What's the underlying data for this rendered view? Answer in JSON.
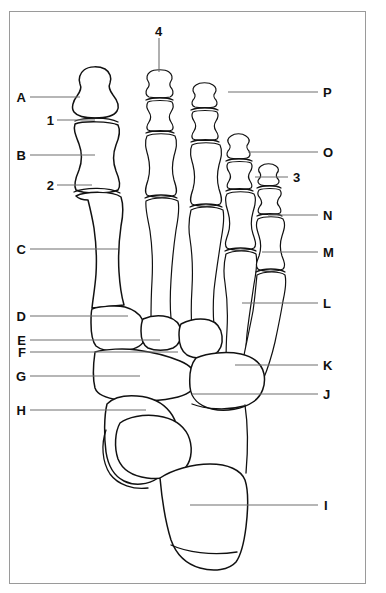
{
  "figure": {
    "type": "anatomical-diagram",
    "background_color": "#ffffff",
    "border_color": "#9a9a9a",
    "outline_color": "#111111",
    "leader_color": "#6f6f6f"
  },
  "labels": {
    "left": [
      {
        "id": "A",
        "text": "A",
        "x": 18,
        "y": 91,
        "leader_from": 30,
        "leader_to": 80,
        "leader_y": 97
      },
      {
        "id": "1",
        "text": "1",
        "x": 46,
        "y": 114,
        "leader_from": 57,
        "leader_to": 95,
        "leader_y": 120
      },
      {
        "id": "B",
        "text": "B",
        "x": 18,
        "y": 149,
        "leader_from": 30,
        "leader_to": 95,
        "leader_y": 155
      },
      {
        "id": "2",
        "text": "2",
        "x": 46,
        "y": 179,
        "leader_from": 57,
        "leader_to": 92,
        "leader_y": 185
      },
      {
        "id": "C",
        "text": "C",
        "x": 18,
        "y": 243,
        "leader_from": 30,
        "leader_to": 118,
        "leader_y": 249
      },
      {
        "id": "D",
        "text": "D",
        "x": 18,
        "y": 310,
        "leader_from": 30,
        "leader_to": 128,
        "leader_y": 316
      },
      {
        "id": "E",
        "text": "E",
        "x": 18,
        "y": 334,
        "leader_from": 30,
        "leader_to": 160,
        "leader_y": 340
      },
      {
        "id": "F",
        "text": "F",
        "x": 18,
        "y": 346,
        "leader_from": 30,
        "leader_to": 178,
        "leader_y": 352
      },
      {
        "id": "G",
        "text": "G",
        "x": 18,
        "y": 370,
        "leader_from": 30,
        "leader_to": 140,
        "leader_y": 376
      },
      {
        "id": "H",
        "text": "H",
        "x": 18,
        "y": 404,
        "leader_from": 30,
        "leader_to": 146,
        "leader_y": 410
      }
    ],
    "right": [
      {
        "id": "P",
        "text": "P",
        "x": 325,
        "y": 86,
        "leader_from": 228,
        "leader_to": 318,
        "leader_y": 92
      },
      {
        "id": "O",
        "text": "O",
        "x": 325,
        "y": 146,
        "leader_from": 248,
        "leader_to": 318,
        "leader_y": 152
      },
      {
        "id": "3",
        "text": "3",
        "x": 294,
        "y": 171,
        "leader_from": 255,
        "leader_to": 288,
        "leader_y": 177
      },
      {
        "id": "N",
        "text": "N",
        "x": 325,
        "y": 209,
        "leader_from": 268,
        "leader_to": 318,
        "leader_y": 215
      },
      {
        "id": "M",
        "text": "M",
        "x": 325,
        "y": 246,
        "leader_from": 262,
        "leader_to": 318,
        "leader_y": 252
      },
      {
        "id": "L",
        "text": "L",
        "x": 325,
        "y": 297,
        "leader_from": 242,
        "leader_to": 318,
        "leader_y": 303
      },
      {
        "id": "K",
        "text": "K",
        "x": 325,
        "y": 359,
        "leader_from": 235,
        "leader_to": 318,
        "leader_y": 365
      },
      {
        "id": "J",
        "text": "J",
        "x": 325,
        "y": 388,
        "leader_from": 192,
        "leader_to": 318,
        "leader_y": 394
      },
      {
        "id": "I",
        "text": "I",
        "x": 325,
        "y": 499,
        "leader_from": 190,
        "leader_to": 318,
        "leader_y": 505
      }
    ],
    "top": [
      {
        "id": "4",
        "text": "4",
        "x": 153,
        "y": 25,
        "leader_x": 159,
        "leader_from": 38,
        "leader_to": 72
      }
    ]
  }
}
